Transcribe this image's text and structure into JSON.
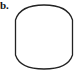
{
  "figure": {
    "panel_label": "b.",
    "shape": {
      "description": "rounded barrel / lens-sided rectangle outline",
      "stroke_color": "#222222",
      "fill_color": "#ffffff",
      "stroke_width": 1.3
    }
  }
}
